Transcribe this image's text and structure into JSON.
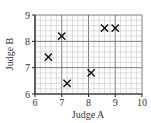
{
  "chart_data": {
    "type": "scatter",
    "title": "",
    "xlabel": "Judge A",
    "ylabel": "Judge B",
    "xlim": [
      6,
      10
    ],
    "ylim": [
      6,
      9
    ],
    "xticks": [
      6,
      7,
      8,
      9,
      10
    ],
    "yticks": [
      6,
      7,
      8,
      9
    ],
    "grid": true,
    "minor_grid_step": 0.2,
    "marker": "x",
    "legend": null,
    "points": [
      {
        "x": 6.5,
        "y": 7.4
      },
      {
        "x": 7.0,
        "y": 8.2
      },
      {
        "x": 7.2,
        "y": 6.4
      },
      {
        "x": 8.1,
        "y": 6.8
      },
      {
        "x": 8.6,
        "y": 8.5
      },
      {
        "x": 9.0,
        "y": 8.5
      }
    ]
  },
  "colors": {
    "minor_grid": "#bdbdbd",
    "major_grid": "#6f6f6f",
    "axis": "#222222",
    "marker": "#111111"
  },
  "layout": {
    "plot_left": 35,
    "plot_right": 142,
    "plot_top": 15,
    "plot_bottom": 94
  }
}
